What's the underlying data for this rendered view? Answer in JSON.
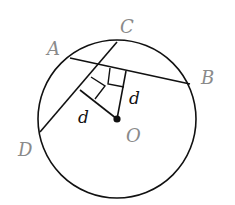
{
  "diagram": {
    "circle": {
      "cx": 117,
      "cy": 119,
      "r": 79,
      "stroke": "#111111"
    },
    "center": {
      "label": "O",
      "x": 117,
      "y": 119
    },
    "points": {
      "A": {
        "label": "A",
        "x": 70,
        "y": 58
      },
      "B": {
        "label": "B",
        "x": 190,
        "y": 84
      },
      "C": {
        "label": "C",
        "x": 117,
        "y": 42
      },
      "D": {
        "label": "D",
        "x": 40,
        "y": 132
      }
    },
    "chords": [
      {
        "name": "AB",
        "from": "A",
        "to": "B"
      },
      {
        "name": "CD",
        "from": "C",
        "to": "D"
      }
    ],
    "perpendiculars": [
      {
        "to_chord": "AB",
        "label": "d"
      },
      {
        "to_chord": "CD",
        "label": "d"
      }
    ],
    "labels": {
      "A": "A",
      "B": "B",
      "C": "C",
      "D": "D",
      "O": "O",
      "d1": "d",
      "d2": "d"
    },
    "colors": {
      "line": "#111111",
      "point_label": "#8a8a8a",
      "distance_label": "#111111"
    }
  }
}
